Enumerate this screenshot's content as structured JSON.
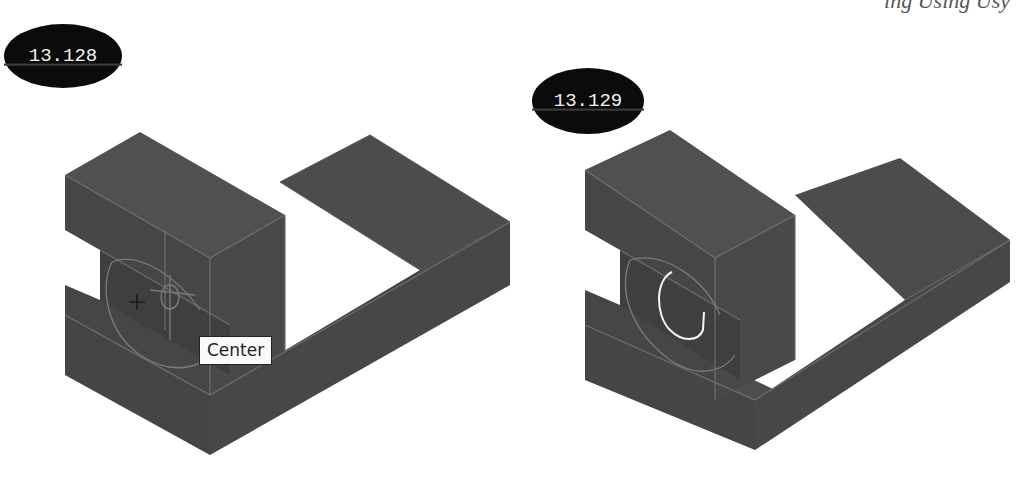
{
  "page": {
    "header_fragment": "ing Using Usy"
  },
  "figures": [
    {
      "id": "left",
      "badge": "13.128",
      "tooltip": "Center",
      "cursor": "crosshair",
      "highlighted_circle": false
    },
    {
      "id": "right",
      "badge": "13.129",
      "highlighted_circle": true
    }
  ],
  "colors": {
    "model_fill": "#4a4a4a",
    "model_top": "#505050",
    "model_side": "#444444",
    "edge": "#6e6e6e",
    "highlight": "#f5f5f5",
    "badge_bg": "#0b0b0b",
    "badge_text": "#f2f2f2"
  }
}
